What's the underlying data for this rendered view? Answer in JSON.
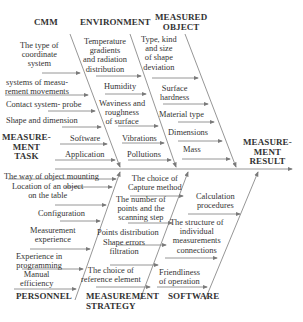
{
  "diagram": {
    "type": "ishikawa-fishbone",
    "effect": "MEASURE-\nMENT\nRESULT",
    "effect_lines": [
      "MEASURE-",
      "MENT",
      "RESULT"
    ],
    "categories": {
      "cmm": {
        "label": "CMM",
        "causes": [
          "The type of coordinate system",
          "systems of measu- rement movements",
          "Contact system- probe",
          "Shape and dimension"
        ]
      },
      "environment": {
        "label": "ENVIRONMENT",
        "causes": [
          "Temperature gradients and radiation distribution",
          "Humidity",
          "Waviness and roughness of surface",
          "Vibrations",
          "Pollutions"
        ]
      },
      "measured_object": {
        "label_lines": [
          "MEASURED",
          "OBJECT"
        ],
        "causes": [
          "Type, kind and size of shape deviation",
          "Surface hardness",
          "Material type",
          "Dimensions",
          "Mass"
        ]
      },
      "measurement_task": {
        "label_lines": [
          "MEASURE-",
          "MENT",
          "TASK"
        ],
        "causes": [
          "Software",
          "Application"
        ]
      },
      "personnel": {
        "label": "PERSONNEL",
        "causes": [
          "The way of object mounting",
          "Location of an object on the table",
          "Configuration",
          "Measurement experience",
          "Experience in programming",
          "Manual efficiency"
        ]
      },
      "measurement_strategy": {
        "label_lines": [
          "MEASUREMENT",
          "STRATEGY"
        ],
        "causes": [
          "The choice of Capture method",
          "The number of points and the scanning step",
          "Points distribution",
          "Shape errors filtration",
          "The choice of reference element"
        ]
      },
      "software": {
        "label": "SOFTWARE",
        "causes": [
          "Calculation procedures",
          "The structure of individual measurements connections",
          "Friendliness of operation"
        ]
      }
    },
    "colors": {
      "line": "#8a8a8a",
      "text": "#333333",
      "background": "#ffffff"
    }
  },
  "text": {
    "cmm": "CMM",
    "env": "ENVIRONMENT",
    "mo1": "MEASURED",
    "mo2": "OBJECT",
    "mt1": "MEASURE-",
    "mt2": "MENT",
    "mt3": "TASK",
    "res1": "MEASURE-",
    "res2": "MENT",
    "res3": "RESULT",
    "pers": "PERSONNEL",
    "ms1": "MEASUREMENT",
    "ms2": "STRATEGY",
    "sw": "SOFTWARE",
    "c1a": "The type of",
    "c1b": "coordinate",
    "c1c": "system",
    "c2a": "systems of measu-",
    "c2b": "rement movements",
    "c3": "Contact system- probe",
    "c4": "Shape and dimension",
    "e1a": "Temperature",
    "e1b": "gradients",
    "e1c": "and radiation",
    "e1d": "distribution",
    "e2": "Humidity",
    "e3a": "Waviness and",
    "e3b": "roughness",
    "e3c": "of surface",
    "e4": "Vibrations",
    "e5": "Pollutions",
    "o1a": "Type, kind",
    "o1b": "and size",
    "o1c": "of shape",
    "o1d": "deviation",
    "o2a": "Surface",
    "o2b": "hardness",
    "o3": "Material type",
    "o4": "Dimensions",
    "o5": "Mass",
    "t1": "Software",
    "t2": "Application",
    "p1": "The way of object mounting",
    "p2a": "Location of an object",
    "p2b": "on the table",
    "p3": "Configuration",
    "p4a": "Measurement",
    "p4b": "experience",
    "p5a": "Experience in",
    "p5b": "programming",
    "p6a": "Manual",
    "p6b": "efficiency",
    "s1a": "The choice of",
    "s1b": "Capture method",
    "s2a": "The number of",
    "s2b": "points and the",
    "s2c": "scanning step",
    "s3": "Points distribution",
    "s4a": "Shape errors",
    "s4b": "filtration",
    "s5a": "The choice of",
    "s5b": "reference element",
    "w1a": "Calculation",
    "w1b": "procedures",
    "w2a": "The structure of",
    "w2b": "individual",
    "w2c": "measurements",
    "w2d": "connections",
    "w3a": "Friendliness",
    "w3b": "of operation"
  }
}
